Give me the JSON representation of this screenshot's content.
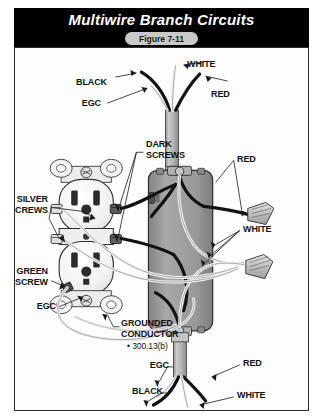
{
  "header": {
    "title": "Multiwire Branch Circuits",
    "figure_label": "Figure 7-11"
  },
  "diagram": {
    "labels": {
      "black_top": "BLACK",
      "white_top": "WHITE",
      "red_top": "RED",
      "egc_top": "EGC",
      "dark_screws": "DARK\nSCREWS",
      "silver_screws": "SILVER\nSCREWS",
      "green_screw": "GREEN\nSCREW",
      "egc_left": "EGC",
      "grounded_conductor": "GROUNDED\nCONDUCTOR",
      "grounded_conductor_code": "• 300.13(b)",
      "red_right": "RED",
      "white_right": "WHITE",
      "red_bottom": "RED",
      "white_bottom": "WHITE",
      "black_bottom": "BLACK",
      "egc_bottom": "EGC"
    },
    "colors": {
      "header_background": "#000000",
      "header_text": "#ffffff",
      "badge_background": "#c9c9c9",
      "frame_border": "#2b2b2b",
      "page_background": "#ffffff",
      "black_conductor": "#111111",
      "white_conductor": "#f2f2f2",
      "red_conductor": "#1a1a1a",
      "egc_conductor": "#e8e8e8",
      "box_fill": "#9a9a9a",
      "cable_sheath": "#b8b8b8",
      "device_fill": "#f4f4f4",
      "wire_nut_fill": "#d0d0d0"
    },
    "components": {
      "receptacle": "duplex-receptacle",
      "junction_box": "junction-box",
      "cable_top": "nm-cable-top",
      "cable_bottom": "nm-cable-bottom",
      "wire_nut_count": 3
    }
  }
}
